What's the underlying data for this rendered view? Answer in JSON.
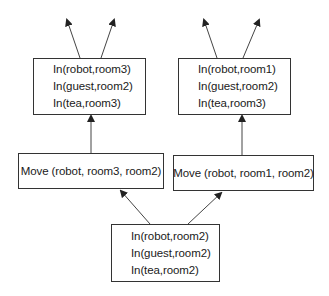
{
  "diagram": {
    "type": "planning-search-tree",
    "nodes": {
      "goal_left": {
        "lines": [
          "In(robot,room3)",
          "In(guest,room2)",
          "In(tea,room3)"
        ]
      },
      "goal_right": {
        "lines": [
          "In(robot,room1)",
          "In(guest,room2)",
          "In(tea,room3)"
        ]
      },
      "action_left": {
        "label": "Move (robot, room3, room2)"
      },
      "action_right": {
        "label": "Move (robot, room1, room2)"
      },
      "initial": {
        "lines": [
          "In(robot,room2)",
          "In(guest,room2)",
          "In(tea,room2)"
        ]
      }
    },
    "edges": [
      {
        "from": "initial",
        "to": "action_left"
      },
      {
        "from": "initial",
        "to": "action_right"
      },
      {
        "from": "action_left",
        "to": "goal_left"
      },
      {
        "from": "action_right",
        "to": "goal_right"
      },
      {
        "from": "goal_left",
        "to": "continuation-1"
      },
      {
        "from": "goal_left",
        "to": "continuation-2"
      },
      {
        "from": "goal_right",
        "to": "continuation-3"
      },
      {
        "from": "goal_right",
        "to": "continuation-4"
      }
    ],
    "colors": {
      "line": "#333333",
      "text": "#1a1a1a",
      "background": "#ffffff"
    }
  }
}
